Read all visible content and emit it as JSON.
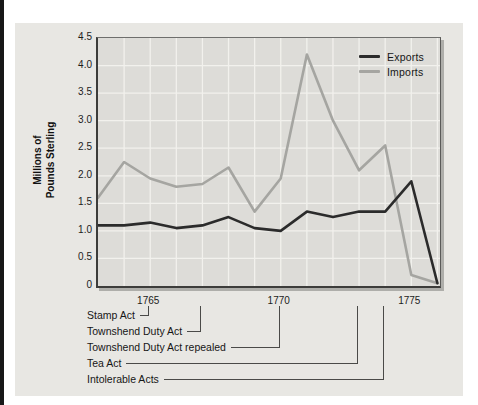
{
  "figure": {
    "y_axis_title_line1": "Millions of",
    "y_axis_title_line2": "Pounds Sterling"
  },
  "chart_data": {
    "type": "line",
    "title": "",
    "ylabel": "Millions of Pounds Sterling",
    "ylabel_line1": "Millions of",
    "ylabel_line2": "Pounds Sterling",
    "xlabel": "",
    "grid": true,
    "legend_position": "top-right",
    "ylim": [
      0,
      4.5
    ],
    "xlim": [
      1763,
      1776.1
    ],
    "x": [
      1763,
      1764,
      1765,
      1766,
      1767,
      1768,
      1769,
      1770,
      1771,
      1772,
      1773,
      1774,
      1775,
      1776
    ],
    "series": [
      {
        "name": "Exports",
        "color": "#2b2b2b",
        "values": [
          1.1,
          1.1,
          1.15,
          1.05,
          1.1,
          1.25,
          1.05,
          1.0,
          1.35,
          1.25,
          1.35,
          1.35,
          1.9,
          0.05
        ]
      },
      {
        "name": "Imports",
        "color": "#a5a5a1",
        "values": [
          1.6,
          2.25,
          1.95,
          1.8,
          1.85,
          2.15,
          1.35,
          1.95,
          4.2,
          3.0,
          2.1,
          2.55,
          0.2,
          0.05
        ]
      }
    ],
    "y_ticks": [
      {
        "label": "4.5",
        "value": 4.5
      },
      {
        "label": "4.0",
        "value": 4.0
      },
      {
        "label": "3.5",
        "value": 3.5
      },
      {
        "label": "3.0",
        "value": 3.0
      },
      {
        "label": "2.5",
        "value": 2.5
      },
      {
        "label": "2.0",
        "value": 2.0
      },
      {
        "label": "1.5",
        "value": 1.5
      },
      {
        "label": "1.0",
        "value": 1.0
      },
      {
        "label": "0.5",
        "value": 0.5
      },
      {
        "label": "0",
        "value": 0
      }
    ],
    "x_ticks": [
      {
        "label": "1765",
        "year": 1765
      },
      {
        "label": "1770",
        "year": 1770
      },
      {
        "label": "1775",
        "year": 1775
      }
    ],
    "gridline_color": "#f2f1ed",
    "annotations": [
      {
        "label": "Stamp Act",
        "year": 1765
      },
      {
        "label": "Townshend Duty Act",
        "year": 1767
      },
      {
        "label": "Townshend Duty Act repealed",
        "year": 1770
      },
      {
        "label": "Tea Act",
        "year": 1773
      },
      {
        "label": "Intolerable Acts",
        "year": 1774
      }
    ]
  }
}
